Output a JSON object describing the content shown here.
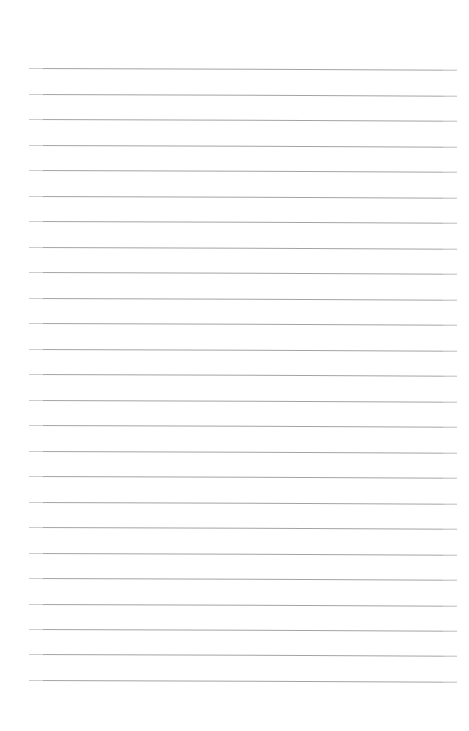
{
  "page": {
    "kind": "lined-paper",
    "title": "",
    "background_color": "#ffffff",
    "width": 469,
    "height": 731,
    "text_content": "",
    "notes": ""
  },
  "rules": {
    "line_color": "#9c9c9e",
    "line_thickness_px": 1,
    "line_count": 25,
    "first_line_y": 68,
    "last_line_y": 680,
    "line_spacing_px": 25.5,
    "line_start_x": 29,
    "line_end_x": 457,
    "tilt_degrees": 0.22,
    "lines": [
      {
        "index": 1,
        "y": 68,
        "x_start": 29,
        "x_end": 457,
        "text": ""
      },
      {
        "index": 2,
        "y": 94,
        "x_start": 29,
        "x_end": 457,
        "text": ""
      },
      {
        "index": 3,
        "y": 119,
        "x_start": 29,
        "x_end": 457,
        "text": ""
      },
      {
        "index": 4,
        "y": 145,
        "x_start": 29,
        "x_end": 457,
        "text": ""
      },
      {
        "index": 5,
        "y": 170,
        "x_start": 29,
        "x_end": 457,
        "text": ""
      },
      {
        "index": 6,
        "y": 196,
        "x_start": 29,
        "x_end": 457,
        "text": ""
      },
      {
        "index": 7,
        "y": 221,
        "x_start": 29,
        "x_end": 457,
        "text": ""
      },
      {
        "index": 8,
        "y": 247,
        "x_start": 29,
        "x_end": 457,
        "text": ""
      },
      {
        "index": 9,
        "y": 272,
        "x_start": 29,
        "x_end": 457,
        "text": ""
      },
      {
        "index": 10,
        "y": 298,
        "x_start": 29,
        "x_end": 457,
        "text": ""
      },
      {
        "index": 11,
        "y": 323,
        "x_start": 29,
        "x_end": 457,
        "text": ""
      },
      {
        "index": 12,
        "y": 349,
        "x_start": 29,
        "x_end": 457,
        "text": ""
      },
      {
        "index": 13,
        "y": 374,
        "x_start": 29,
        "x_end": 457,
        "text": ""
      },
      {
        "index": 14,
        "y": 400,
        "x_start": 29,
        "x_end": 457,
        "text": ""
      },
      {
        "index": 15,
        "y": 425,
        "x_start": 29,
        "x_end": 457,
        "text": ""
      },
      {
        "index": 16,
        "y": 451,
        "x_start": 29,
        "x_end": 457,
        "text": ""
      },
      {
        "index": 17,
        "y": 476,
        "x_start": 29,
        "x_end": 457,
        "text": ""
      },
      {
        "index": 18,
        "y": 502,
        "x_start": 29,
        "x_end": 457,
        "text": ""
      },
      {
        "index": 19,
        "y": 527,
        "x_start": 29,
        "x_end": 457,
        "text": ""
      },
      {
        "index": 20,
        "y": 553,
        "x_start": 29,
        "x_end": 457,
        "text": ""
      },
      {
        "index": 21,
        "y": 578,
        "x_start": 29,
        "x_end": 457,
        "text": ""
      },
      {
        "index": 22,
        "y": 604,
        "x_start": 29,
        "x_end": 457,
        "text": ""
      },
      {
        "index": 23,
        "y": 629,
        "x_start": 29,
        "x_end": 457,
        "text": ""
      },
      {
        "index": 24,
        "y": 654,
        "x_start": 29,
        "x_end": 457,
        "text": ""
      },
      {
        "index": 25,
        "y": 680,
        "x_start": 29,
        "x_end": 457,
        "text": ""
      }
    ]
  },
  "margins": {
    "top_px": 68,
    "bottom_px": 51,
    "left_px": 29,
    "right_px": 12
  }
}
